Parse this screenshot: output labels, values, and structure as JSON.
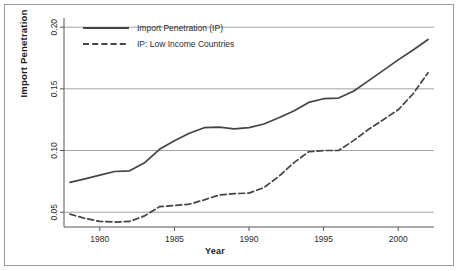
{
  "chart_data": {
    "type": "line",
    "title": "",
    "xlabel": "Year",
    "ylabel": "Import Penetration",
    "xlim": [
      1977.6,
      2002.4
    ],
    "ylim": [
      0.038,
      0.205
    ],
    "grid": true,
    "gridlines_y": [
      0.05,
      0.1,
      0.15,
      0.2
    ],
    "xticks": [
      1980,
      1985,
      1990,
      1995,
      2000
    ],
    "xtick_labels": [
      "1980",
      "1985",
      "1990",
      "1995",
      "2000"
    ],
    "yticks": [
      0.05,
      0.1,
      0.15,
      0.2
    ],
    "ytick_labels": [
      "0.05",
      "0.10",
      "0.15",
      "0.20"
    ],
    "legend_position": "top-left",
    "x": [
      1978,
      1979,
      1980,
      1981,
      1982,
      1983,
      1984,
      1985,
      1986,
      1987,
      1988,
      1989,
      1990,
      1991,
      1992,
      1993,
      1994,
      1995,
      1996,
      1997,
      1998,
      1999,
      2000,
      2001,
      2002
    ],
    "series": [
      {
        "name": "Import Penetration (IP)",
        "style": "solid",
        "color": "#444444",
        "values": [
          0.0742,
          0.077,
          0.08,
          0.083,
          0.0835,
          0.09,
          0.101,
          0.108,
          0.114,
          0.1185,
          0.119,
          0.1175,
          0.1185,
          0.1215,
          0.1265,
          0.132,
          0.139,
          0.142,
          0.1425,
          0.148,
          0.1565,
          0.165,
          0.1735,
          0.1815,
          0.19
        ]
      },
      {
        "name": "IP: Low Income Countries",
        "style": "dashed",
        "color": "#444444",
        "values": [
          0.0484,
          0.045,
          0.0425,
          0.042,
          0.0425,
          0.047,
          0.0545,
          0.0555,
          0.0565,
          0.06,
          0.064,
          0.065,
          0.0655,
          0.07,
          0.079,
          0.09,
          0.099,
          0.1,
          0.1,
          0.108,
          0.117,
          0.125,
          0.133,
          0.146,
          0.163
        ]
      }
    ],
    "legend": [
      {
        "label": "Import Penetration (IP)",
        "style": "solid"
      },
      {
        "label": "IP: Low Income Countries",
        "style": "dashed"
      }
    ]
  }
}
